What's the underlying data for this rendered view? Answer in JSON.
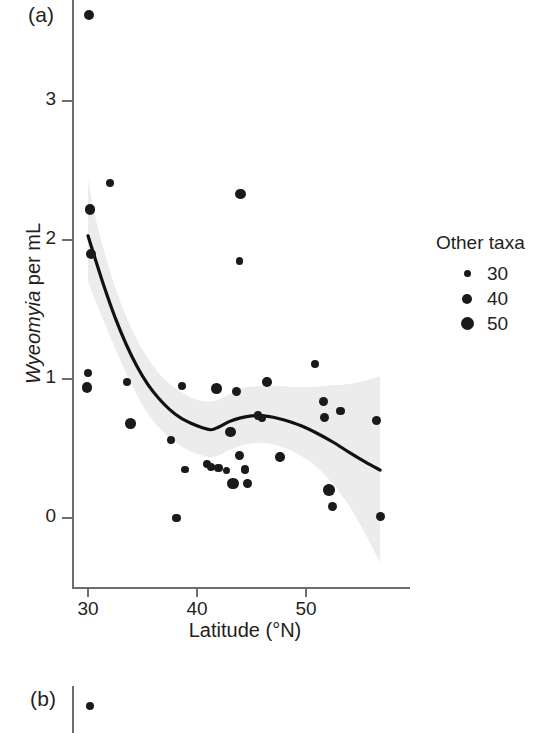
{
  "figure": {
    "panel_a_label": "(a)",
    "panel_b_label": "(b)"
  },
  "legend": {
    "title": "Other taxa",
    "entries": [
      {
        "label": "30",
        "diameter_px": 7
      },
      {
        "label": "40",
        "diameter_px": 10
      },
      {
        "label": "50",
        "diameter_px": 13
      }
    ]
  },
  "chart_data": {
    "type": "scatter",
    "title": "",
    "xlabel": "Latitude (°N)",
    "ylabel": "Wyeomyia per mL",
    "ylabel_italic_part": "Wyeomyia",
    "ylabel_roman_part": " per mL",
    "xlim": [
      28.5,
      59.5
    ],
    "ylim": [
      -0.5,
      3.75
    ],
    "xticks": [
      30,
      40,
      50
    ],
    "xtick_labels": [
      "30",
      "40",
      "50"
    ],
    "yticks": [
      0,
      1,
      2,
      3
    ],
    "ytick_labels": [
      "0",
      "1",
      "2",
      "3"
    ],
    "grid": false,
    "legend_position": "right",
    "size_legend_title": "Other taxa",
    "size_legend_values": [
      30,
      40,
      50
    ],
    "bubble_size_variable": "Other taxa",
    "points": [
      {
        "x": 30.1,
        "y": 3.62,
        "size": 40
      },
      {
        "x": 30.2,
        "y": 2.22,
        "size": 42
      },
      {
        "x": 30.3,
        "y": 1.9,
        "size": 40
      },
      {
        "x": 30.0,
        "y": 1.04,
        "size": 33
      },
      {
        "x": 29.9,
        "y": 0.94,
        "size": 42
      },
      {
        "x": 32.0,
        "y": 2.41,
        "size": 34
      },
      {
        "x": 33.6,
        "y": 0.98,
        "size": 34
      },
      {
        "x": 33.9,
        "y": 0.68,
        "size": 42
      },
      {
        "x": 37.6,
        "y": 0.56,
        "size": 33
      },
      {
        "x": 38.1,
        "y": 0.0,
        "size": 35
      },
      {
        "x": 38.6,
        "y": 0.95,
        "size": 33
      },
      {
        "x": 38.9,
        "y": 0.35,
        "size": 31
      },
      {
        "x": 40.9,
        "y": 0.39,
        "size": 34
      },
      {
        "x": 41.3,
        "y": 0.37,
        "size": 33
      },
      {
        "x": 41.8,
        "y": 0.93,
        "size": 42
      },
      {
        "x": 42.0,
        "y": 0.36,
        "size": 36
      },
      {
        "x": 42.7,
        "y": 0.34,
        "size": 30
      },
      {
        "x": 43.1,
        "y": 0.62,
        "size": 42
      },
      {
        "x": 43.3,
        "y": 0.25,
        "size": 44
      },
      {
        "x": 43.6,
        "y": 0.91,
        "size": 38
      },
      {
        "x": 43.9,
        "y": 0.45,
        "size": 39
      },
      {
        "x": 44.0,
        "y": 2.33,
        "size": 42
      },
      {
        "x": 43.9,
        "y": 1.85,
        "size": 33
      },
      {
        "x": 44.4,
        "y": 0.35,
        "size": 36
      },
      {
        "x": 44.6,
        "y": 0.25,
        "size": 36
      },
      {
        "x": 45.6,
        "y": 0.74,
        "size": 36
      },
      {
        "x": 46.0,
        "y": 0.72,
        "size": 34
      },
      {
        "x": 46.4,
        "y": 0.98,
        "size": 39
      },
      {
        "x": 47.6,
        "y": 0.44,
        "size": 38
      },
      {
        "x": 50.8,
        "y": 1.11,
        "size": 34
      },
      {
        "x": 51.6,
        "y": 0.84,
        "size": 36
      },
      {
        "x": 51.7,
        "y": 0.72,
        "size": 37
      },
      {
        "x": 52.1,
        "y": 0.2,
        "size": 45
      },
      {
        "x": 52.4,
        "y": 0.08,
        "size": 37
      },
      {
        "x": 53.2,
        "y": 0.77,
        "size": 36
      },
      {
        "x": 56.5,
        "y": 0.7,
        "size": 37
      },
      {
        "x": 56.8,
        "y": 0.01,
        "size": 36
      }
    ],
    "fit_line": {
      "name": "smoothed fit (LOESS/GAM)",
      "color": "#111111",
      "points": [
        {
          "x": 30.0,
          "y": 2.03
        },
        {
          "x": 30.6,
          "y": 1.88
        },
        {
          "x": 31.5,
          "y": 1.66
        },
        {
          "x": 32.5,
          "y": 1.44
        },
        {
          "x": 33.5,
          "y": 1.25
        },
        {
          "x": 34.5,
          "y": 1.09
        },
        {
          "x": 35.5,
          "y": 0.96
        },
        {
          "x": 36.5,
          "y": 0.86
        },
        {
          "x": 37.5,
          "y": 0.78
        },
        {
          "x": 38.5,
          "y": 0.72
        },
        {
          "x": 39.5,
          "y": 0.68
        },
        {
          "x": 40.5,
          "y": 0.65
        },
        {
          "x": 41.3,
          "y": 0.635
        },
        {
          "x": 42.0,
          "y": 0.655
        },
        {
          "x": 43.0,
          "y": 0.695
        },
        {
          "x": 44.0,
          "y": 0.72
        },
        {
          "x": 45.0,
          "y": 0.735
        },
        {
          "x": 46.0,
          "y": 0.735
        },
        {
          "x": 47.0,
          "y": 0.725
        },
        {
          "x": 48.0,
          "y": 0.705
        },
        {
          "x": 49.5,
          "y": 0.665
        },
        {
          "x": 51.0,
          "y": 0.61
        },
        {
          "x": 52.5,
          "y": 0.545
        },
        {
          "x": 54.0,
          "y": 0.47
        },
        {
          "x": 55.5,
          "y": 0.4
        },
        {
          "x": 56.8,
          "y": 0.345
        }
      ]
    },
    "confidence_band": {
      "name": "95% confidence band",
      "color": "#ececec",
      "upper": [
        {
          "x": 30.0,
          "y": 2.43
        },
        {
          "x": 31.0,
          "y": 2.06
        },
        {
          "x": 32.5,
          "y": 1.66
        },
        {
          "x": 34.0,
          "y": 1.36
        },
        {
          "x": 35.5,
          "y": 1.15
        },
        {
          "x": 37.0,
          "y": 1.0
        },
        {
          "x": 38.5,
          "y": 0.91
        },
        {
          "x": 40.0,
          "y": 0.85
        },
        {
          "x": 41.5,
          "y": 0.84
        },
        {
          "x": 43.0,
          "y": 0.89
        },
        {
          "x": 44.5,
          "y": 0.94
        },
        {
          "x": 46.0,
          "y": 0.95
        },
        {
          "x": 47.5,
          "y": 0.95
        },
        {
          "x": 49.5,
          "y": 0.94
        },
        {
          "x": 51.5,
          "y": 0.95
        },
        {
          "x": 53.5,
          "y": 0.96
        },
        {
          "x": 55.0,
          "y": 0.98
        },
        {
          "x": 56.8,
          "y": 1.02
        }
      ],
      "lower": [
        {
          "x": 30.0,
          "y": 1.7
        },
        {
          "x": 31.0,
          "y": 1.5
        },
        {
          "x": 32.5,
          "y": 1.22
        },
        {
          "x": 34.0,
          "y": 0.96
        },
        {
          "x": 35.5,
          "y": 0.75
        },
        {
          "x": 37.0,
          "y": 0.61
        },
        {
          "x": 38.5,
          "y": 0.52
        },
        {
          "x": 40.0,
          "y": 0.46
        },
        {
          "x": 41.5,
          "y": 0.44
        },
        {
          "x": 43.0,
          "y": 0.49
        },
        {
          "x": 44.5,
          "y": 0.53
        },
        {
          "x": 46.0,
          "y": 0.54
        },
        {
          "x": 47.5,
          "y": 0.52
        },
        {
          "x": 49.5,
          "y": 0.45
        },
        {
          "x": 51.5,
          "y": 0.33
        },
        {
          "x": 53.5,
          "y": 0.14
        },
        {
          "x": 55.0,
          "y": -0.05
        },
        {
          "x": 56.8,
          "y": -0.32
        }
      ]
    },
    "panel_b_points": [
      {
        "x_px": 90,
        "y_px": 706,
        "size": 34
      }
    ]
  }
}
